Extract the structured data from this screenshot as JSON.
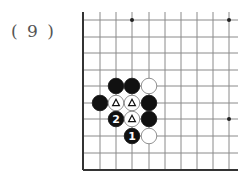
{
  "problem": {
    "label": "( 9 )"
  },
  "board": {
    "grid_x": [
      83,
      100,
      116,
      132,
      149,
      165,
      181,
      197,
      213,
      229
    ],
    "grid_y": [
      20,
      37,
      53,
      70,
      86,
      103,
      119,
      136,
      153,
      170
    ],
    "right_extent": 238,
    "top_extent": 12,
    "line_color": "#8a8a8a",
    "edge_color": "#333333",
    "star_points": [
      [
        132,
        20
      ],
      [
        229,
        20
      ],
      [
        229,
        119
      ]
    ],
    "stones": [
      {
        "color": "black",
        "x": 116,
        "y": 86,
        "mark": ""
      },
      {
        "color": "black",
        "x": 132,
        "y": 86,
        "mark": ""
      },
      {
        "color": "white",
        "x": 149,
        "y": 86,
        "mark": ""
      },
      {
        "color": "black",
        "x": 100,
        "y": 103,
        "mark": ""
      },
      {
        "color": "white",
        "x": 116,
        "y": 103,
        "mark": "triangle"
      },
      {
        "color": "white",
        "x": 132,
        "y": 103,
        "mark": "triangle"
      },
      {
        "color": "black",
        "x": 149,
        "y": 103,
        "mark": ""
      },
      {
        "color": "black",
        "x": 116,
        "y": 119,
        "mark": "2"
      },
      {
        "color": "white",
        "x": 132,
        "y": 119,
        "mark": "triangle"
      },
      {
        "color": "black",
        "x": 149,
        "y": 119,
        "mark": ""
      },
      {
        "color": "black",
        "x": 132,
        "y": 136,
        "mark": "1"
      },
      {
        "color": "white",
        "x": 149,
        "y": 136,
        "mark": ""
      }
    ]
  }
}
